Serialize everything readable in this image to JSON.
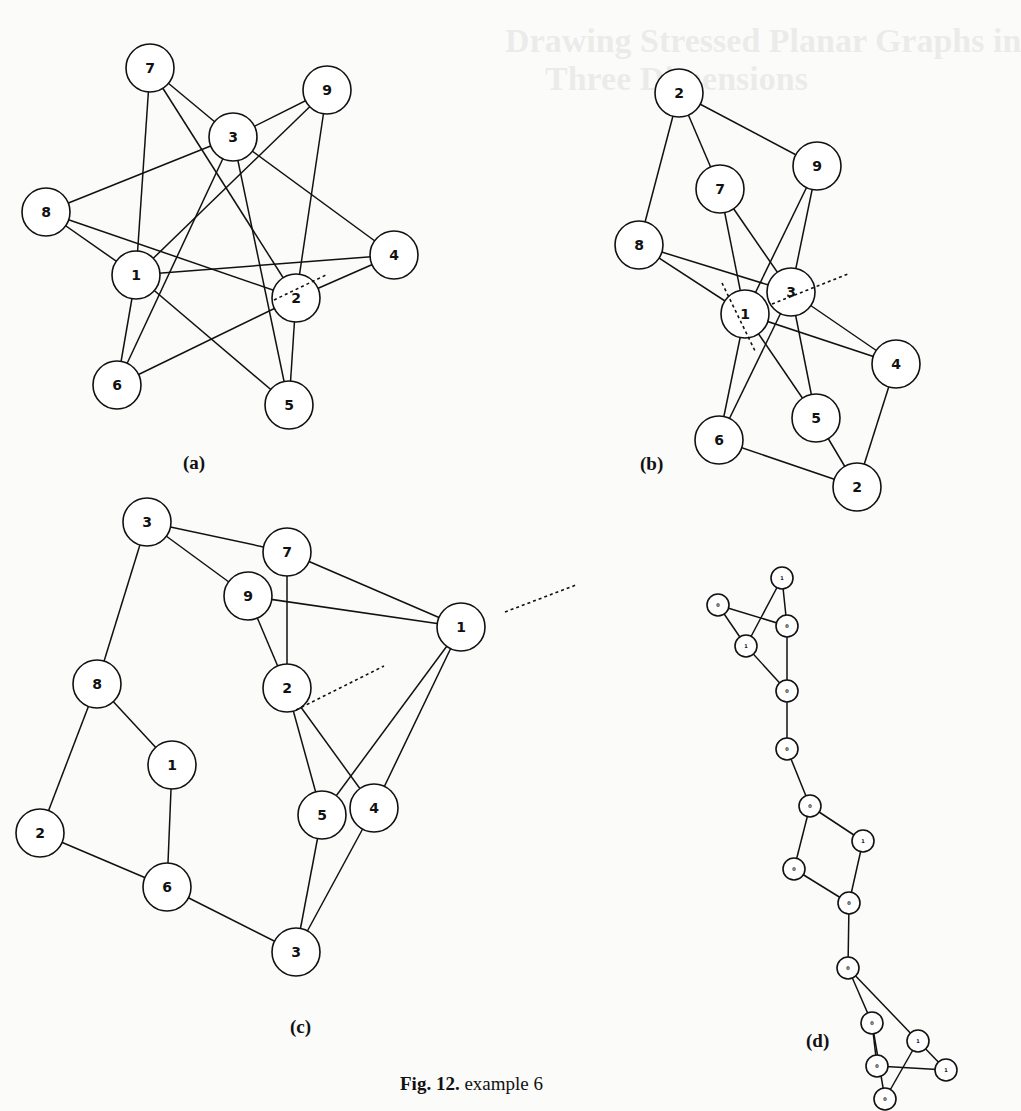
{
  "background_showthrough": {
    "title_line1": "Drawing Stressed Planar Graphs in",
    "title_line2": "Three Dimensions"
  },
  "figure": {
    "caption_label": "Fig. 12.",
    "caption_text": "example 6",
    "panels": [
      {
        "id": "a",
        "label": "(a)",
        "label_pos": [
          183,
          452
        ],
        "node_r": 24,
        "font": 14,
        "nodes": [
          {
            "id": "7",
            "x": 150,
            "y": 68
          },
          {
            "id": "9",
            "x": 327,
            "y": 90
          },
          {
            "id": "3",
            "x": 233,
            "y": 137
          },
          {
            "id": "8",
            "x": 46,
            "y": 212
          },
          {
            "id": "4",
            "x": 394,
            "y": 255
          },
          {
            "id": "1",
            "x": 136,
            "y": 275
          },
          {
            "id": "2",
            "x": 296,
            "y": 298
          },
          {
            "id": "6",
            "x": 117,
            "y": 385
          },
          {
            "id": "5",
            "x": 289,
            "y": 405
          }
        ],
        "edges": [
          [
            "7",
            "1"
          ],
          [
            "7",
            "3"
          ],
          [
            "7",
            "2"
          ],
          [
            "9",
            "3"
          ],
          [
            "9",
            "1"
          ],
          [
            "9",
            "2"
          ],
          [
            "3",
            "8"
          ],
          [
            "3",
            "6"
          ],
          [
            "3",
            "5"
          ],
          [
            "3",
            "4"
          ],
          [
            "8",
            "1"
          ],
          [
            "8",
            "2"
          ],
          [
            "1",
            "4"
          ],
          [
            "1",
            "6"
          ],
          [
            "1",
            "5"
          ],
          [
            "2",
            "4"
          ],
          [
            "2",
            "6"
          ],
          [
            "2",
            "5"
          ]
        ],
        "cuts": [
          [
            274,
            300,
            326,
            275
          ]
        ]
      },
      {
        "id": "b",
        "label": "(b)",
        "label_pos": [
          640,
          453
        ],
        "node_r": 24,
        "font": 14,
        "nodes": [
          {
            "id": "2",
            "key": "2t",
            "x": 679,
            "y": 93
          },
          {
            "id": "9",
            "x": 817,
            "y": 166
          },
          {
            "id": "7",
            "x": 720,
            "y": 189
          },
          {
            "id": "8",
            "x": 639,
            "y": 245
          },
          {
            "id": "3",
            "x": 791,
            "y": 292
          },
          {
            "id": "1",
            "x": 745,
            "y": 314
          },
          {
            "id": "4",
            "x": 896,
            "y": 364
          },
          {
            "id": "5",
            "x": 816,
            "y": 418
          },
          {
            "id": "6",
            "x": 719,
            "y": 440
          },
          {
            "id": "2",
            "key": "2b",
            "x": 857,
            "y": 487
          }
        ],
        "edges": [
          [
            "2t",
            "7"
          ],
          [
            "2t",
            "9"
          ],
          [
            "2t",
            "8"
          ],
          [
            "7",
            "1"
          ],
          [
            "7",
            "3"
          ],
          [
            "9",
            "1"
          ],
          [
            "9",
            "3"
          ],
          [
            "8",
            "1"
          ],
          [
            "8",
            "3"
          ],
          [
            "1",
            "6"
          ],
          [
            "1",
            "5"
          ],
          [
            "1",
            "4"
          ],
          [
            "3",
            "6"
          ],
          [
            "3",
            "5"
          ],
          [
            "3",
            "4"
          ],
          [
            "6",
            "2b"
          ],
          [
            "5",
            "2b"
          ],
          [
            "4",
            "2b"
          ]
        ],
        "cuts": [
          [
            722,
            283,
            756,
            353
          ],
          [
            772,
            304,
            848,
            274
          ]
        ]
      },
      {
        "id": "c",
        "label": "(c)",
        "label_pos": [
          290,
          1016
        ],
        "node_r": 24,
        "font": 14,
        "nodes": [
          {
            "id": "3",
            "key": "3t",
            "x": 147,
            "y": 522
          },
          {
            "id": "7",
            "x": 287,
            "y": 552
          },
          {
            "id": "9",
            "x": 248,
            "y": 596
          },
          {
            "id": "1",
            "key": "1r",
            "x": 461,
            "y": 627
          },
          {
            "id": "8",
            "x": 97,
            "y": 684
          },
          {
            "id": "2",
            "key": "2m",
            "x": 287,
            "y": 688
          },
          {
            "id": "1",
            "key": "1l",
            "x": 172,
            "y": 765
          },
          {
            "id": "5",
            "x": 322,
            "y": 815
          },
          {
            "id": "4",
            "x": 374,
            "y": 808
          },
          {
            "id": "2",
            "key": "2l",
            "x": 40,
            "y": 833
          },
          {
            "id": "6",
            "x": 167,
            "y": 887
          },
          {
            "id": "3",
            "key": "3b",
            "x": 296,
            "y": 952
          }
        ],
        "edges": [
          [
            "3t",
            "7"
          ],
          [
            "3t",
            "9"
          ],
          [
            "3t",
            "8"
          ],
          [
            "7",
            "1r"
          ],
          [
            "7",
            "2m"
          ],
          [
            "9",
            "1r"
          ],
          [
            "9",
            "2m"
          ],
          [
            "1r",
            "5"
          ],
          [
            "1r",
            "4"
          ],
          [
            "8",
            "1l"
          ],
          [
            "8",
            "2l"
          ],
          [
            "1l",
            "6"
          ],
          [
            "2l",
            "6"
          ],
          [
            "6",
            "3b"
          ],
          [
            "2m",
            "5"
          ],
          [
            "2m",
            "4"
          ],
          [
            "5",
            "3b"
          ],
          [
            "4",
            "3b"
          ]
        ],
        "cuts": [
          [
            296,
            710,
            384,
            666
          ],
          [
            505,
            612,
            576,
            585
          ]
        ]
      },
      {
        "id": "d",
        "label": "(d)",
        "label_pos": [
          806,
          1030
        ],
        "node_r": 11,
        "font": 5,
        "nodes": [
          {
            "id": "1",
            "key": "d1",
            "x": 782,
            "y": 578
          },
          {
            "id": "0",
            "key": "d2",
            "x": 718,
            "y": 605
          },
          {
            "id": "0",
            "key": "d3",
            "x": 787,
            "y": 626
          },
          {
            "id": "1",
            "key": "d4",
            "x": 746,
            "y": 646
          },
          {
            "id": "0",
            "key": "d5",
            "x": 787,
            "y": 691
          },
          {
            "id": "0",
            "key": "d6",
            "x": 787,
            "y": 749
          },
          {
            "id": "0",
            "key": "d7",
            "x": 810,
            "y": 806
          },
          {
            "id": "1",
            "key": "d8",
            "x": 863,
            "y": 841
          },
          {
            "id": "0",
            "key": "d9",
            "x": 794,
            "y": 869
          },
          {
            "id": "0",
            "key": "d10",
            "x": 849,
            "y": 903
          },
          {
            "id": "0",
            "key": "d11",
            "x": 848,
            "y": 968
          },
          {
            "id": "0",
            "key": "d12",
            "x": 872,
            "y": 1023
          },
          {
            "id": "1",
            "key": "d13",
            "x": 918,
            "y": 1041
          },
          {
            "id": "0",
            "key": "d14",
            "x": 877,
            "y": 1066
          },
          {
            "id": "1",
            "key": "d15",
            "x": 946,
            "y": 1070
          },
          {
            "id": "0",
            "key": "d16",
            "x": 885,
            "y": 1099
          }
        ],
        "edges": [
          [
            "d2",
            "d3"
          ],
          [
            "d2",
            "d4"
          ],
          [
            "d1",
            "d3"
          ],
          [
            "d1",
            "d4"
          ],
          [
            "d3",
            "d5"
          ],
          [
            "d4",
            "d5"
          ],
          [
            "d5",
            "d6"
          ],
          [
            "d6",
            "d7"
          ],
          [
            "d7",
            "d8"
          ],
          [
            "d7",
            "d9"
          ],
          [
            "d8",
            "d10"
          ],
          [
            "d9",
            "d10"
          ],
          [
            "d10",
            "d11"
          ],
          [
            "d11",
            "d12"
          ],
          [
            "d11",
            "d13"
          ],
          [
            "d12",
            "d14"
          ],
          [
            "d13",
            "d16"
          ],
          [
            "d14",
            "d15"
          ],
          [
            "d12",
            "d16"
          ],
          [
            "d13",
            "d15"
          ]
        ],
        "cuts": []
      }
    ]
  }
}
